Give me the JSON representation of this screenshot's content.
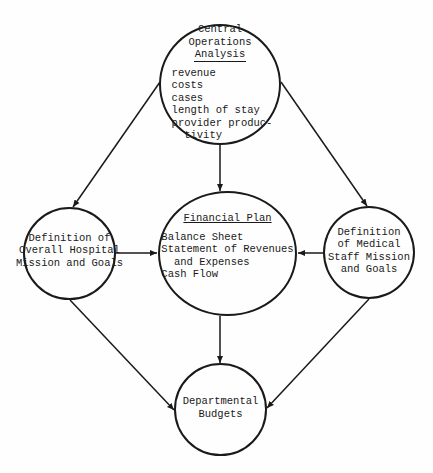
{
  "nodes": {
    "central_operations": {
      "title": "Central\nOperations\nAnalysis",
      "items": "revenue\ncosts\ncases\nlength of stay\nprovider produc-\n  tivity"
    },
    "hospital_mission": {
      "label": "Definition of\nOverall Hospital\nMission and Goals"
    },
    "financial_plan": {
      "title": "Financial Plan",
      "items": "Balance Sheet\nStatement of Revenues\n  and Expenses\nCash Flow"
    },
    "medical_staff_mission": {
      "label": "Definition\nof Medical\nStaff Mission\nand Goals"
    },
    "departmental_budgets": {
      "label": "Departmental\nBudgets"
    }
  },
  "edges": [
    {
      "from": "central_operations",
      "to": "hospital_mission"
    },
    {
      "from": "central_operations",
      "to": "financial_plan"
    },
    {
      "from": "central_operations",
      "to": "medical_staff_mission"
    },
    {
      "from": "hospital_mission",
      "to": "financial_plan"
    },
    {
      "from": "medical_staff_mission",
      "to": "financial_plan"
    },
    {
      "from": "hospital_mission",
      "to": "departmental_budgets"
    },
    {
      "from": "financial_plan",
      "to": "departmental_budgets"
    },
    {
      "from": "medical_staff_mission",
      "to": "departmental_budgets"
    }
  ]
}
